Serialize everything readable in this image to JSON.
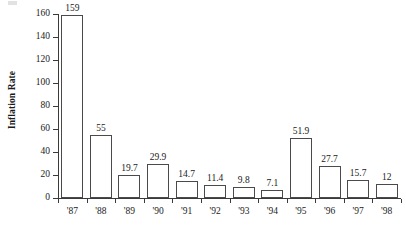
{
  "chart_data": {
    "type": "bar",
    "title": "",
    "subtitle": "",
    "xlabel": "",
    "ylabel": "Inflation Rate",
    "categories": [
      "'87",
      "'88",
      "'89",
      "'90",
      "'91",
      "'92",
      "'93",
      "'94",
      "'95",
      "'96",
      "'97",
      "'98"
    ],
    "values": [
      159,
      55,
      19.7,
      29.9,
      14.7,
      11.4,
      9.8,
      7.1,
      51.9,
      27.7,
      15.7,
      12
    ],
    "value_labels": [
      "159",
      "55",
      "19.7",
      "29.9",
      "14.7",
      "11.4",
      "9.8",
      "7.1",
      "51.9",
      "27.7",
      "15.7",
      "12"
    ],
    "ylim": [
      0,
      160
    ],
    "ytick_values": [
      0,
      20,
      40,
      60,
      80,
      100,
      120,
      140,
      160
    ],
    "ytick_labels": [
      "0",
      "20",
      "40",
      "60",
      "80",
      "100",
      "120",
      "140",
      "160"
    ],
    "grid": false,
    "legend": null,
    "bar_fill_color": "#ffffff",
    "bar_border_color": "#4a4a4a",
    "axis_color": "#3a3a3a",
    "text_color": "#1a1a1a",
    "background_color": "#ffffff"
  }
}
